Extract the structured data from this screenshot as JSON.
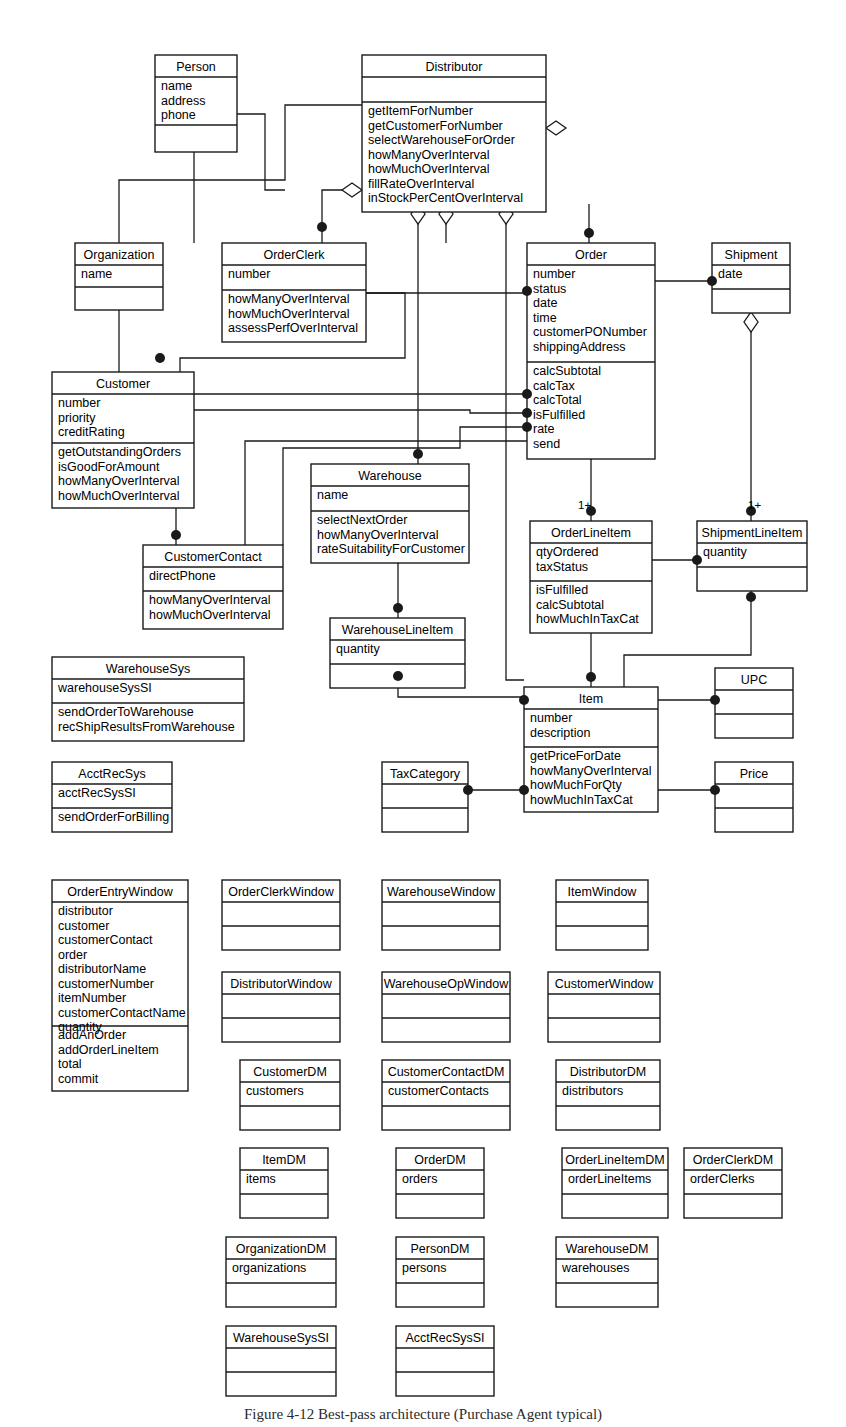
{
  "figure": {
    "caption": "Figure 4-12  Best-pass architecture (Purchase Agent typical)",
    "caption_y": 1406
  },
  "diagram": {
    "type": "uml-class-diagram",
    "width": 846,
    "height": 1427,
    "line_color": "#1a1a1a",
    "fill_color": "#ffffff",
    "classes": [
      {
        "id": "person",
        "name": "Person",
        "x": 155,
        "y": 55,
        "w": 82,
        "name_h": 22,
        "attr_h": 48,
        "op_h": 27,
        "attributes": [
          "name",
          "address",
          "phone"
        ],
        "operations": []
      },
      {
        "id": "distributor",
        "name": "Distributor",
        "x": 362,
        "y": 55,
        "w": 184,
        "name_h": 22,
        "attr_h": 25,
        "op_h": 110,
        "attributes": [],
        "operations": [
          "getItemForNumber",
          "getCustomerForNumber",
          "selectWarehouseForOrder",
          "howManyOverInterval",
          "howMuchOverInterval",
          "fillRateOverInterval",
          "inStockPerCentOverInterval"
        ]
      },
      {
        "id": "organization",
        "name": "Organization",
        "x": 75,
        "y": 243,
        "w": 88,
        "name_h": 22,
        "attr_h": 22,
        "op_h": 23,
        "attributes": [
          "name"
        ],
        "operations": []
      },
      {
        "id": "orderclerk",
        "name": "OrderClerk",
        "x": 222,
        "y": 243,
        "w": 144,
        "name_h": 22,
        "attr_h": 25,
        "op_h": 52,
        "attributes": [
          "number"
        ],
        "operations": [
          "howManyOverInterval",
          "howMuchOverInterval",
          "assessPerfOverInterval"
        ]
      },
      {
        "id": "order",
        "name": "Order",
        "x": 527,
        "y": 243,
        "w": 128,
        "name_h": 22,
        "attr_h": 97,
        "op_h": 97,
        "attributes": [
          "number",
          "status",
          "date",
          "time",
          "customerPONumber",
          "shippingAddress"
        ],
        "operations": [
          "calcSubtotal",
          "calcTax",
          "calcTotal",
          "isFulfilled",
          "rate",
          "send"
        ]
      },
      {
        "id": "shipment",
        "name": "Shipment",
        "x": 712,
        "y": 243,
        "w": 78,
        "name_h": 22,
        "attr_h": 24,
        "op_h": 24,
        "attributes": [
          "date"
        ],
        "operations": []
      },
      {
        "id": "customer",
        "name": "Customer",
        "x": 52,
        "y": 372,
        "w": 142,
        "name_h": 22,
        "attr_h": 49,
        "op_h": 65,
        "attributes": [
          "number",
          "priority",
          "creditRating"
        ],
        "operations": [
          "getOutstandingOrders",
          "isGoodForAmount",
          "howManyOverInterval",
          "howMuchOverInterval"
        ]
      },
      {
        "id": "warehouse",
        "name": "Warehouse",
        "x": 311,
        "y": 464,
        "w": 158,
        "name_h": 22,
        "attr_h": 25,
        "op_h": 52,
        "attributes": [
          "name"
        ],
        "operations": [
          "selectNextOrder",
          "howManyOverInterval",
          "rateSuitabilityForCustomer"
        ]
      },
      {
        "id": "customercontact",
        "name": "CustomerContact",
        "x": 143,
        "y": 545,
        "w": 140,
        "name_h": 22,
        "attr_h": 24,
        "op_h": 38,
        "attributes": [
          "directPhone"
        ],
        "operations": [
          "howManyOverInterval",
          "howMuchOverInterval"
        ]
      },
      {
        "id": "orderlineitem",
        "name": "OrderLineItem",
        "x": 530,
        "y": 521,
        "w": 122,
        "name_h": 22,
        "attr_h": 38,
        "op_h": 52,
        "attributes": [
          "qtyOrdered",
          "taxStatus"
        ],
        "operations": [
          "isFulfilled",
          "calcSubtotal",
          "howMuchInTaxCat"
        ]
      },
      {
        "id": "shipmentlineitem",
        "name": "ShipmentLineItem",
        "x": 697,
        "y": 521,
        "w": 110,
        "name_h": 22,
        "attr_h": 24,
        "op_h": 24,
        "attributes": [
          "quantity"
        ],
        "operations": []
      },
      {
        "id": "warehouselineitem",
        "name": "WarehouseLineItem",
        "x": 330,
        "y": 618,
        "w": 135,
        "name_h": 22,
        "attr_h": 24,
        "op_h": 24,
        "attributes": [
          "quantity"
        ],
        "operations": []
      },
      {
        "id": "warehousesys",
        "name": "WarehouseSys",
        "x": 52,
        "y": 657,
        "w": 192,
        "name_h": 22,
        "attr_h": 24,
        "op_h": 38,
        "attributes": [
          "warehouseSysSI"
        ],
        "operations": [
          "sendOrderToWarehouse",
          "recShipResultsFromWarehouse"
        ]
      },
      {
        "id": "upc",
        "name": "UPC",
        "x": 715,
        "y": 668,
        "w": 78,
        "name_h": 22,
        "attr_h": 24,
        "op_h": 24,
        "attributes": [],
        "operations": []
      },
      {
        "id": "item",
        "name": "Item",
        "x": 524,
        "y": 687,
        "w": 134,
        "name_h": 22,
        "attr_h": 38,
        "op_h": 65,
        "attributes": [
          "number",
          "description"
        ],
        "operations": [
          "getPriceForDate",
          "howManyOverInterval",
          "howMuchForQty",
          "howMuchInTaxCat"
        ]
      },
      {
        "id": "acctrecsys",
        "name": "AcctRecSys",
        "x": 52,
        "y": 762,
        "w": 120,
        "name_h": 22,
        "attr_h": 24,
        "op_h": 24,
        "attributes": [
          "acctRecSysSI"
        ],
        "operations": [
          "sendOrderForBilling"
        ]
      },
      {
        "id": "taxcategory",
        "name": "TaxCategory",
        "x": 382,
        "y": 762,
        "w": 86,
        "name_h": 22,
        "attr_h": 24,
        "op_h": 24,
        "attributes": [],
        "operations": []
      },
      {
        "id": "price",
        "name": "Price",
        "x": 715,
        "y": 762,
        "w": 78,
        "name_h": 22,
        "attr_h": 24,
        "op_h": 24,
        "attributes": [],
        "operations": []
      },
      {
        "id": "orderentrywindow",
        "name": "OrderEntryWindow",
        "x": 52,
        "y": 880,
        "w": 136,
        "name_h": 22,
        "attr_h": 124,
        "op_h": 65,
        "attributes": [
          "distributor",
          "customer",
          "customerContact",
          "order",
          "distributorName",
          "customerNumber",
          "itemNumber",
          "customerContactName",
          "quantity"
        ],
        "operations": [
          "addAnOrder",
          "addOrderLineItem",
          "total",
          "commit"
        ]
      },
      {
        "id": "orderclerkwindow",
        "name": "OrderClerkWindow",
        "x": 222,
        "y": 880,
        "w": 118,
        "name_h": 22,
        "attr_h": 24,
        "op_h": 24,
        "attributes": [],
        "operations": []
      },
      {
        "id": "warehousewindow",
        "name": "WarehouseWindow",
        "x": 382,
        "y": 880,
        "w": 118,
        "name_h": 22,
        "attr_h": 24,
        "op_h": 24,
        "attributes": [],
        "operations": []
      },
      {
        "id": "itemwindow",
        "name": "ItemWindow",
        "x": 556,
        "y": 880,
        "w": 92,
        "name_h": 22,
        "attr_h": 24,
        "op_h": 24,
        "attributes": [],
        "operations": []
      },
      {
        "id": "distributorwindow",
        "name": "DistributorWindow",
        "x": 222,
        "y": 972,
        "w": 118,
        "name_h": 22,
        "attr_h": 24,
        "op_h": 24,
        "attributes": [],
        "operations": []
      },
      {
        "id": "warehouseopwindow",
        "name": "WarehouseOpWindow",
        "x": 382,
        "y": 972,
        "w": 128,
        "name_h": 22,
        "attr_h": 24,
        "op_h": 24,
        "attributes": [],
        "operations": []
      },
      {
        "id": "customerwindow",
        "name": "CustomerWindow",
        "x": 548,
        "y": 972,
        "w": 112,
        "name_h": 22,
        "attr_h": 24,
        "op_h": 24,
        "attributes": [],
        "operations": []
      },
      {
        "id": "customerdm",
        "name": "CustomerDM",
        "x": 240,
        "y": 1060,
        "w": 100,
        "name_h": 22,
        "attr_h": 24,
        "op_h": 24,
        "attributes": [
          "customers"
        ],
        "operations": []
      },
      {
        "id": "customercontactdm",
        "name": "CustomerContactDM",
        "x": 382,
        "y": 1060,
        "w": 128,
        "name_h": 22,
        "attr_h": 24,
        "op_h": 24,
        "attributes": [
          "customerContacts"
        ],
        "operations": []
      },
      {
        "id": "distributordm",
        "name": "DistributorDM",
        "x": 556,
        "y": 1060,
        "w": 104,
        "name_h": 22,
        "attr_h": 24,
        "op_h": 24,
        "attributes": [
          "distributors"
        ],
        "operations": []
      },
      {
        "id": "itemdm",
        "name": "ItemDM",
        "x": 240,
        "y": 1148,
        "w": 88,
        "name_h": 22,
        "attr_h": 24,
        "op_h": 24,
        "attributes": [
          "items"
        ],
        "operations": []
      },
      {
        "id": "orderdm",
        "name": "OrderDM",
        "x": 396,
        "y": 1148,
        "w": 88,
        "name_h": 22,
        "attr_h": 24,
        "op_h": 24,
        "attributes": [
          "orders"
        ],
        "operations": []
      },
      {
        "id": "orderlineitemdm",
        "name": "OrderLineItemDM",
        "x": 562,
        "y": 1148,
        "w": 106,
        "name_h": 22,
        "attr_h": 24,
        "op_h": 24,
        "attributes": [
          "orderLineItems"
        ],
        "operations": []
      },
      {
        "id": "orderclerkdm",
        "name": "OrderClerkDM",
        "x": 684,
        "y": 1148,
        "w": 98,
        "name_h": 22,
        "attr_h": 24,
        "op_h": 24,
        "attributes": [
          "orderClerks"
        ],
        "operations": []
      },
      {
        "id": "organizationdm",
        "name": "OrganizationDM",
        "x": 226,
        "y": 1237,
        "w": 110,
        "name_h": 22,
        "attr_h": 24,
        "op_h": 24,
        "attributes": [
          "organizations"
        ],
        "operations": []
      },
      {
        "id": "persondm",
        "name": "PersonDM",
        "x": 396,
        "y": 1237,
        "w": 88,
        "name_h": 22,
        "attr_h": 24,
        "op_h": 24,
        "attributes": [
          "persons"
        ],
        "operations": []
      },
      {
        "id": "warehousedm",
        "name": "WarehouseDM",
        "x": 556,
        "y": 1237,
        "w": 102,
        "name_h": 22,
        "attr_h": 24,
        "op_h": 24,
        "attributes": [
          "warehouses"
        ],
        "operations": []
      },
      {
        "id": "warehousesyssi",
        "name": "WarehouseSysSI",
        "x": 226,
        "y": 1326,
        "w": 110,
        "name_h": 22,
        "attr_h": 24,
        "op_h": 24,
        "attributes": [],
        "operations": []
      },
      {
        "id": "acctrecsyssi",
        "name": "AcctRecSysSI",
        "x": 396,
        "y": 1326,
        "w": 98,
        "name_h": 22,
        "attr_h": 24,
        "op_h": 24,
        "attributes": [],
        "operations": []
      }
    ],
    "multiplicities": [
      {
        "label": "1+",
        "x": 578,
        "y": 509
      },
      {
        "label": "1+",
        "x": 748,
        "y": 509
      }
    ],
    "connectors": [
      {
        "id": "person-distributor",
        "d": "M 237 114 L 265 114 L 265 190 L 285 190"
      },
      {
        "id": "person-orderclerk",
        "d": "M 194 152 L 194 243"
      },
      {
        "id": "organization-person",
        "d": "M 119 243 L 119 180 L 285 180 L 285 105 L 362 105"
      },
      {
        "id": "orderclerk-distributor-agg",
        "d": "M 322 243 L 322 190 L 345 190 L 362 190"
      },
      {
        "id": "organization-customer",
        "d": "M 119 310 L 119 372"
      },
      {
        "id": "orderclerk-order",
        "d": "M 366 293 L 405 293 L 405 358 L 180 358 L 180 372"
      },
      {
        "id": "orderclerk-order2",
        "d": "M 366 293 L 527 293"
      },
      {
        "id": "customer-customercontact",
        "d": "M 176 502 L 176 545"
      },
      {
        "id": "customer-order",
        "d": "M 194 394 L 527 394"
      },
      {
        "id": "customer-order2",
        "d": "M 194 410 L 470 410 L 470 413 L 527 413"
      },
      {
        "id": "distributor-order",
        "d": "M 589 204 L 589 243"
      },
      {
        "id": "distributor-warehouse",
        "d": "M 418 204 L 418 464"
      },
      {
        "id": "distributor-orderclerk2",
        "d": "M 446 204 L 446 243"
      },
      {
        "id": "distributor-customer",
        "d": "M 506 204 L 506 680 L 524 680"
      },
      {
        "id": "order-shipment",
        "d": "M 655 281 L 712 281"
      },
      {
        "id": "shipment-shipmentlineitem",
        "d": "M 751 291 L 751 521"
      },
      {
        "id": "order-orderlineitem",
        "d": "M 591 437 L 591 521"
      },
      {
        "id": "orderlineitem-shipmentlineitem",
        "d": "M 652 560 L 697 560"
      },
      {
        "id": "warehouse-warehouselineitem",
        "d": "M 398 541 L 398 618"
      },
      {
        "id": "warehouselineitem-item",
        "d": "M 398 666 L 398 697 L 524 697"
      },
      {
        "id": "orderlineitem-item",
        "d": "M 591 633 L 591 687"
      },
      {
        "id": "shipmentlineitem-item",
        "d": "M 751 569 L 751 655 L 624 655 L 624 687"
      },
      {
        "id": "item-upc",
        "d": "M 658 700 L 715 700"
      },
      {
        "id": "item-price",
        "d": "M 658 790 L 715 790"
      },
      {
        "id": "taxcategory-item",
        "d": "M 468 790 L 524 790"
      },
      {
        "id": "order-isfulfilled",
        "d": "M 527 427 L 460 427 L 460 448 L 283 448 L 283 545"
      },
      {
        "id": "order-rate",
        "d": "M 527 441 L 245 441 L 245 545"
      }
    ],
    "filled_dots": [
      {
        "x": 322,
        "y": 227
      },
      {
        "x": 160,
        "y": 358
      },
      {
        "x": 589,
        "y": 233
      },
      {
        "x": 418,
        "y": 454
      },
      {
        "x": 712,
        "y": 281
      },
      {
        "x": 527,
        "y": 291
      },
      {
        "x": 527,
        "y": 394
      },
      {
        "x": 527,
        "y": 413
      },
      {
        "x": 527,
        "y": 427
      },
      {
        "x": 176,
        "y": 535
      },
      {
        "x": 398,
        "y": 608
      },
      {
        "x": 398,
        "y": 676
      },
      {
        "x": 591,
        "y": 511
      },
      {
        "x": 751,
        "y": 511
      },
      {
        "x": 697,
        "y": 560
      },
      {
        "x": 751,
        "y": 597
      },
      {
        "x": 591,
        "y": 677
      },
      {
        "x": 524,
        "y": 700
      },
      {
        "x": 715,
        "y": 700
      },
      {
        "x": 524,
        "y": 790
      },
      {
        "x": 715,
        "y": 790
      },
      {
        "x": 468,
        "y": 790
      }
    ],
    "aggregation_diamonds": [
      {
        "x": 556,
        "y": 128,
        "orient": "h"
      },
      {
        "x": 352,
        "y": 190,
        "orient": "h"
      },
      {
        "x": 418,
        "y": 214,
        "orient": "v"
      },
      {
        "x": 446,
        "y": 214,
        "orient": "v"
      },
      {
        "x": 506,
        "y": 214,
        "orient": "v"
      },
      {
        "x": 591,
        "y": 449,
        "orient": "v"
      },
      {
        "x": 751,
        "y": 322,
        "orient": "v"
      },
      {
        "x": 398,
        "y": 553,
        "orient": "v"
      }
    ]
  }
}
